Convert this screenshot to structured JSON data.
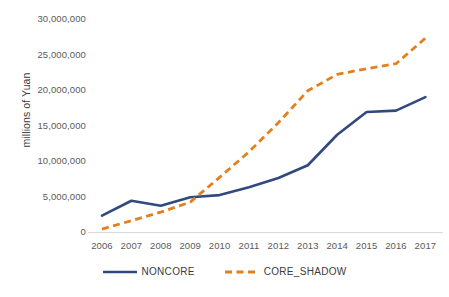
{
  "chart_data": {
    "type": "line",
    "title": "",
    "xlabel": "",
    "ylabel": "millions of Yuan",
    "categories": [
      "2006",
      "2007",
      "2008",
      "2009",
      "2010",
      "2011",
      "2012",
      "2013",
      "2014",
      "2015",
      "2016",
      "2017"
    ],
    "series": [
      {
        "name": "NONCORE",
        "color": "#31497f",
        "style": "solid",
        "values": [
          2300000,
          4400000,
          3700000,
          4900000,
          5200000,
          6300000,
          7600000,
          9400000,
          13700000,
          16900000,
          17100000,
          19000000
        ]
      },
      {
        "name": "CORE_SHADOW",
        "color": "#e0801f",
        "style": "dashed",
        "values": [
          400000,
          1600000,
          2800000,
          4200000,
          7700000,
          11300000,
          15400000,
          19900000,
          22200000,
          23000000,
          23700000,
          27300000
        ]
      }
    ],
    "ylim": [
      0,
      30000000
    ],
    "y_ticks": [
      "0",
      "5,000,000",
      "10,000,000",
      "15,000,000",
      "20,000,000",
      "25,000,000",
      "30,000,000"
    ],
    "y_tick_values": [
      0,
      5000000,
      10000000,
      15000000,
      20000000,
      25000000,
      30000000
    ],
    "grid": false,
    "legend_position": "bottom",
    "axis_line_color": "#d9d9d9",
    "tick_label_color": "#5a5a5a"
  },
  "legend": {
    "items": [
      {
        "label": "NONCORE",
        "color": "#31497f",
        "style": "solid"
      },
      {
        "label": "CORE_SHADOW",
        "color": "#e0801f",
        "style": "dashed"
      }
    ]
  },
  "axis": {
    "y_title": "millions of Yuan"
  },
  "title_sliver": {
    "text": ""
  }
}
